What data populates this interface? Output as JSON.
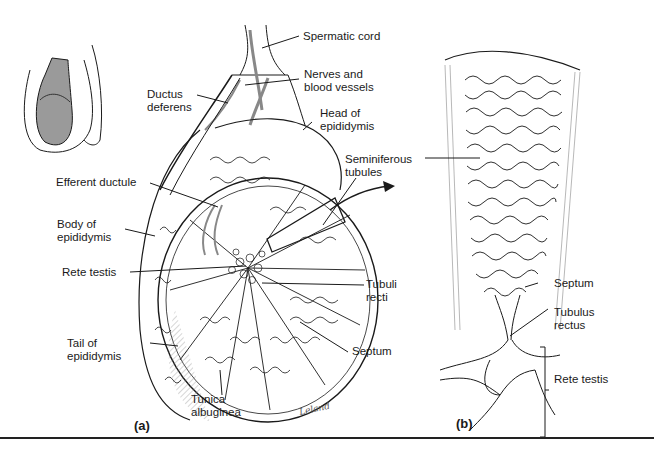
{
  "figure": {
    "panels": [
      {
        "id": "a",
        "tag": "(a)"
      },
      {
        "id": "b",
        "tag": "(b)"
      }
    ],
    "signature": "Leland"
  },
  "labels_a": {
    "spermatic_cord": "Spermatic cord",
    "nerves_1": "Nerves and",
    "nerves_2": "blood vessels",
    "ductus_1": "Ductus",
    "ductus_2": "deferens",
    "head_1": "Head of",
    "head_2": "epididymis",
    "semi_1": "Seminiferous",
    "semi_2": "tubules",
    "efferent": "Efferent ductule",
    "body_1": "Body of",
    "body_2": "epididymis",
    "rete": "Rete testis",
    "tubuli_1": "Tubuli",
    "tubuli_2": "recti",
    "tail_1": "Tail of",
    "tail_2": "epididymis",
    "septum": "Septum",
    "tunica_1": "Tunica",
    "tunica_2": "albuginea"
  },
  "labels_b": {
    "septum": "Septum",
    "tubulus_1": "Tubulus",
    "tubulus_2": "rectus",
    "rete": "Rete testis"
  },
  "colors": {
    "ink": "#1a1a1a",
    "shade": "#9a9a9a",
    "light_shade": "#cfcfcf"
  }
}
